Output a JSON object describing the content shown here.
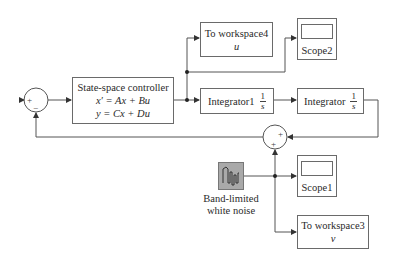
{
  "diagram": {
    "type": "simulink-block-diagram",
    "blocks": {
      "sum1": {
        "signs": [
          "+",
          "−"
        ]
      },
      "state_space": {
        "title": "State-space controller",
        "eq1": "x′ = Ax + Bu",
        "eq2": "y = Cx + Du"
      },
      "to_workspace4": {
        "title": "To workspace4",
        "var": "u"
      },
      "scope2": {
        "label": "Scope2"
      },
      "integrator1": {
        "label": "Integrator1",
        "num": "1",
        "den": "s"
      },
      "integrator": {
        "label": "Integrator",
        "num": "1",
        "den": "s"
      },
      "sum2": {
        "signs": [
          "+",
          "+"
        ]
      },
      "noise": {
        "label_line1": "Band-limited",
        "label_line2": "white noise"
      },
      "scope1": {
        "label": "Scope1"
      },
      "to_workspace3": {
        "title": "To workspace3",
        "var": "v"
      }
    },
    "connections": [
      [
        "sum1",
        "state_space"
      ],
      [
        "state_space",
        "to_workspace4"
      ],
      [
        "state_space",
        "scope2"
      ],
      [
        "state_space",
        "integrator1"
      ],
      [
        "integrator1",
        "integrator"
      ],
      [
        "integrator",
        "sum2"
      ],
      [
        "noise",
        "sum2"
      ],
      [
        "noise",
        "scope1"
      ],
      [
        "noise",
        "to_workspace3"
      ],
      [
        "sum2",
        "sum1"
      ]
    ],
    "colors": {
      "line": "#555555",
      "block_border": "#6a6a6a",
      "noise_fill": "#a9a9a9"
    }
  }
}
